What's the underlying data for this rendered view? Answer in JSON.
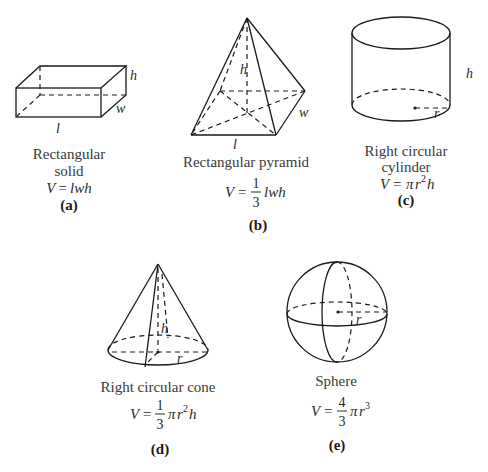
{
  "figures": [
    {
      "id": "a",
      "tag": "(a)",
      "caption_lines": [
        "Rectangular",
        "solid"
      ],
      "formula": "V = lwh",
      "formula_parts": {
        "lhs": "V",
        "eq": "=",
        "rhs": "lwh"
      },
      "labels": {
        "height": "h",
        "width": "w",
        "length": "l"
      }
    },
    {
      "id": "b",
      "tag": "(b)",
      "caption_lines": [
        "Rectangular pyramid"
      ],
      "formula": "V = (1/3) lwh",
      "formula_parts": {
        "lhs": "V",
        "eq": "=",
        "numerator": "1",
        "denominator": "3",
        "rhs": "lwh"
      },
      "labels": {
        "height": "h",
        "width": "w",
        "length": "l"
      }
    },
    {
      "id": "c",
      "tag": "(c)",
      "caption_lines": [
        "Right circular",
        "cylinder"
      ],
      "formula": "V = πr²h",
      "formula_parts": {
        "lhs": "V",
        "eq": "=",
        "pi": "π",
        "r": "r",
        "exp": "2",
        "h": "h"
      },
      "labels": {
        "height": "h",
        "radius": "r"
      }
    },
    {
      "id": "d",
      "tag": "(d)",
      "caption_lines": [
        "Right circular cone"
      ],
      "formula": "V = (1/3) πr²h",
      "formula_parts": {
        "lhs": "V",
        "eq": "=",
        "numerator": "1",
        "denominator": "3",
        "pi": "π",
        "r": "r",
        "exp": "2",
        "h": "h"
      },
      "labels": {
        "height": "h",
        "radius": "r"
      }
    },
    {
      "id": "e",
      "tag": "(e)",
      "caption_lines": [
        "Sphere"
      ],
      "formula": "V = (4/3) πr³",
      "formula_parts": {
        "lhs": "V",
        "eq": "=",
        "numerator": "4",
        "denominator": "3",
        "pi": "π",
        "r": "r",
        "exp": "3"
      },
      "labels": {
        "radius": "r"
      }
    }
  ]
}
